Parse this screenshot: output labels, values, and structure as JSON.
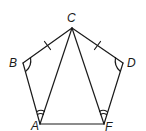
{
  "diagram": {
    "type": "geometry-figure",
    "stroke_color": "#1a1a1a",
    "background": "#ffffff",
    "points": {
      "A": {
        "label": "A",
        "x": 40,
        "y": 124,
        "lx": 31,
        "ly": 130
      },
      "B": {
        "label": "B",
        "x": 23,
        "y": 63,
        "lx": 9,
        "ly": 67
      },
      "C": {
        "label": "C",
        "x": 72,
        "y": 28,
        "lx": 67,
        "ly": 22
      },
      "D": {
        "label": "D",
        "x": 123,
        "y": 63,
        "lx": 127,
        "ly": 67
      },
      "F": {
        "label": "F",
        "x": 104,
        "y": 124,
        "lx": 105,
        "ly": 131
      }
    },
    "segments": [
      [
        "C",
        "B"
      ],
      [
        "B",
        "A"
      ],
      [
        "A",
        "F"
      ],
      [
        "F",
        "D"
      ],
      [
        "D",
        "C"
      ],
      [
        "C",
        "A"
      ],
      [
        "C",
        "F"
      ]
    ],
    "congruence_marks": {
      "single_tick_segments": [
        [
          "C",
          "B"
        ],
        [
          "C",
          "D"
        ]
      ],
      "single_arc_angles": [
        "B",
        "D"
      ],
      "double_arc_angles": [
        {
          "vertex": "A",
          "between": [
            "B",
            "C"
          ]
        },
        {
          "vertex": "F",
          "between": [
            "C",
            "D"
          ]
        }
      ]
    }
  }
}
